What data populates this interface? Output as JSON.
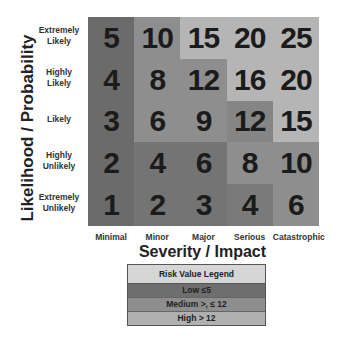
{
  "chart_data": {
    "type": "heatmap",
    "title": "",
    "xlabel": "Severity / Impact",
    "ylabel": "Likelihood / Probability",
    "x_categories": [
      "Minimal",
      "Minor",
      "Major",
      "Serious",
      "Catastrophic"
    ],
    "y_categories_top_to_bottom": [
      "Extremely Likely",
      "Highly Likely",
      "Likely",
      "Highly Unlikely",
      "Extremely Unlikely"
    ],
    "values_top_to_bottom": [
      [
        5,
        10,
        15,
        20,
        25
      ],
      [
        4,
        8,
        12,
        16,
        20
      ],
      [
        3,
        6,
        9,
        12,
        15
      ],
      [
        2,
        4,
        6,
        8,
        10
      ],
      [
        1,
        2,
        3,
        4,
        6
      ]
    ],
    "levels_top_to_bottom": [
      [
        "low-a",
        "medium",
        "high",
        "high",
        "high"
      ],
      [
        "low-a",
        "medium",
        "medium",
        "high",
        "high"
      ],
      [
        "low-a",
        "medium",
        "medium",
        "medium-b",
        "high"
      ],
      [
        "low-a",
        "low",
        "low",
        "medium",
        "medium"
      ],
      [
        "low-a",
        "low",
        "low",
        "low-b",
        "medium"
      ]
    ],
    "legend": {
      "title": "Risk Value Legend",
      "entries": [
        {
          "label": "Low ≤5",
          "level": "low"
        },
        {
          "label": "Medium >, ≤ 12",
          "level": "medium"
        },
        {
          "label": "High > 12",
          "level": "high"
        }
      ]
    }
  },
  "colors": {
    "low-a": "#6b6b6b",
    "low": "#747474",
    "low-b": "#7a7a7a",
    "medium": "#8e8e8e",
    "medium-b": "#858585",
    "high": "#b5b5b5"
  },
  "row_labels": [
    [
      "Extremely",
      "Likely"
    ],
    [
      "Highly",
      "Likely"
    ],
    [
      "Likely"
    ],
    [
      "Highly",
      "Unlikely"
    ],
    [
      "Extremely",
      "Unlikely"
    ]
  ]
}
